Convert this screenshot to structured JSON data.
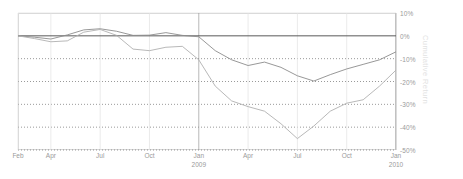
{
  "chart_data": {
    "type": "line",
    "title": "",
    "xlabel": "",
    "ylabel": "Cumulative Return",
    "ylim": [
      -55,
      12
    ],
    "yticks": [
      10,
      0,
      -10,
      -20,
      -30,
      -40,
      -50
    ],
    "ytick_labels": [
      "10%",
      "0%",
      "-10%",
      "-20%",
      "-30%",
      "-40%",
      "-50%"
    ],
    "xtick_labels": [
      {
        "label": "Feb",
        "sub": "",
        "x": 0
      },
      {
        "label": "Apr",
        "sub": "",
        "x": 2
      },
      {
        "label": "Jul",
        "sub": "",
        "x": 5
      },
      {
        "label": "Oct",
        "sub": "",
        "x": 8
      },
      {
        "label": "Jan",
        "sub": "2009",
        "x": 11
      },
      {
        "label": "Apr",
        "sub": "",
        "x": 14
      },
      {
        "label": "Jul",
        "sub": "",
        "x": 17
      },
      {
        "label": "Oct",
        "sub": "",
        "x": 20
      },
      {
        "label": "Jan",
        "sub": "2010",
        "x": 23
      }
    ],
    "grid": true,
    "gridlines_dotted": [
      -10,
      -20,
      -30,
      -40,
      -50
    ],
    "zero_line": 0,
    "legend": "none",
    "x": [
      0,
      1,
      2,
      3,
      4,
      5,
      6,
      7,
      8,
      9,
      10,
      11,
      12,
      13,
      14,
      15,
      16,
      17,
      18,
      19,
      20,
      21,
      22,
      23
    ],
    "series": [
      {
        "name": "series-1",
        "color": "#8c8c8c",
        "values": [
          0,
          -0.6,
          -1.4,
          0.4,
          2.6,
          3.1,
          2.0,
          0.2,
          0.3,
          1.4,
          0.2,
          -0.4,
          -6.5,
          -10.5,
          -13.0,
          -11.5,
          -13.8,
          -17.5,
          -19.8,
          -17.0,
          -14.5,
          -12.5,
          -10.5,
          -7.0
        ]
      },
      {
        "name": "series-2",
        "color": "#b0b0b0",
        "values": [
          0,
          -1.2,
          -2.6,
          -2.2,
          1.6,
          2.8,
          0.2,
          -5.8,
          -6.5,
          -5.0,
          -4.6,
          -10.5,
          -22.0,
          -28.5,
          -31.0,
          -33.0,
          -38.5,
          -45.0,
          -39.5,
          -33.0,
          -29.5,
          -28.0,
          -22.0,
          -15.0
        ]
      }
    ]
  }
}
